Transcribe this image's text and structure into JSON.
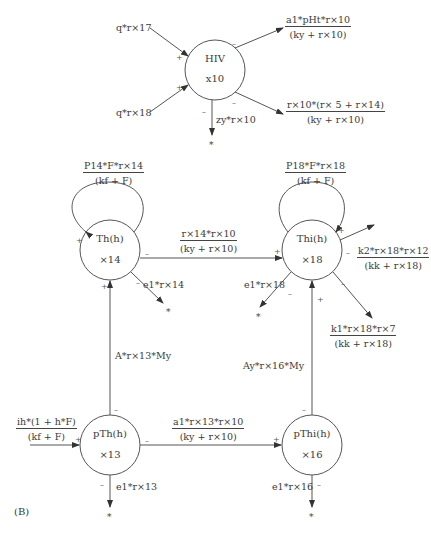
{
  "panel_label": "(B)",
  "nodes": {
    "hiv": {
      "name": "HIV",
      "var": "x10"
    },
    "th": {
      "name": "Th(h)",
      "var": "×14"
    },
    "thi": {
      "name": "Thi(h)",
      "var": "×18"
    },
    "pth": {
      "name": "pTh(h)",
      "var": "×13"
    },
    "pthi": {
      "name": "pThi(h)",
      "var": "×16"
    }
  },
  "hiv_flows": {
    "in1": "q*r×17",
    "in2": "q*r×18",
    "out1": {
      "num": "a1*pHt*r×10",
      "den": "(ky + r×10)"
    },
    "out2": {
      "num": "r×10*(r× 5 + r×14)",
      "den": "(ky + r×10)"
    },
    "out3": "zy*r×10"
  },
  "th_flows": {
    "self": {
      "num": "P14*F*r×14",
      "den": "(kf + F)"
    },
    "to_thi": {
      "num": "r×14*r×10",
      "den": "(ky + r×10)"
    },
    "decay": "e1*r×14"
  },
  "thi_flows": {
    "self": {
      "num": "P18*F*r×18",
      "den": "(kf + F)"
    },
    "out1": {
      "num": "k2*r×18*r×12",
      "den": "(kk + r×18)"
    },
    "out2": {
      "num": "k1*r×18*r×7",
      "den": "(kk + r×18)"
    },
    "decay": "e1*r×18"
  },
  "pth_flows": {
    "input": {
      "num": "ih*(1 + h*F)",
      "den": "(kf + F)"
    },
    "to_th": "A*r×13*My",
    "to_pthi": {
      "num": "a1*r×13*r×10",
      "den": "(ky + r×10)"
    },
    "decay": "e1*r×13"
  },
  "pthi_flows": {
    "to_thi": "Ay*r×16*My",
    "decay": "e1*r×16"
  },
  "signs": {
    "plus": "+",
    "minus": "–",
    "sink": "*"
  }
}
